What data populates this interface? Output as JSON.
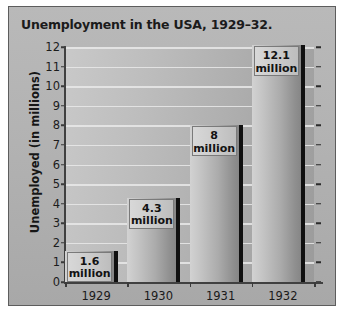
{
  "chart_data": {
    "type": "bar",
    "title": "Unemployment in the USA, 1929–32.",
    "xlabel": "",
    "ylabel": "Unemployed (in millions)",
    "categories": [
      "1929",
      "1930",
      "1931",
      "1932"
    ],
    "values": [
      1.6,
      4.3,
      8,
      12.1
    ],
    "data_labels": [
      "1.6\nmillion",
      "4.3\nmillion",
      "8\nmillion",
      "12.1\nmillion"
    ],
    "data_label_values": [
      "1.6",
      "4.3",
      "8",
      "12.1"
    ],
    "data_label_unit": "million",
    "ylim": [
      0,
      12
    ],
    "yticks": [
      0,
      1,
      2,
      3,
      4,
      5,
      6,
      7,
      8,
      9,
      10,
      11,
      12
    ],
    "ytick_labels": [
      "0",
      "1",
      "2",
      "3",
      "4",
      "5",
      "6",
      "7",
      "8",
      "9",
      "10",
      "11",
      "12"
    ],
    "grid": true,
    "legend": false,
    "series": [
      {
        "name": "Unemployed",
        "values": [
          1.6,
          4.3,
          8,
          12.1
        ]
      }
    ],
    "colors": {
      "panel_background": "#b3b3b3",
      "plot_background": "#b5b5b5",
      "gridline": "#e9e9e9",
      "bar_light": "#d2d2d2",
      "bar_dark": "#868686",
      "bar_shadow": "#101010",
      "axis": "#404040",
      "text": "#1a1a1a",
      "label_box": "#cdcdcd",
      "border": "#5d5d5d"
    }
  }
}
